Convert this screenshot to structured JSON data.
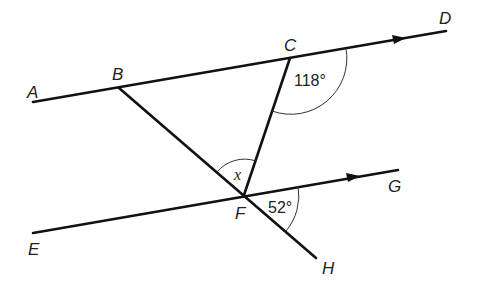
{
  "diagram": {
    "points": {
      "A": {
        "label": "A"
      },
      "B": {
        "label": "B"
      },
      "C": {
        "label": "C"
      },
      "D": {
        "label": "D"
      },
      "E": {
        "label": "E"
      },
      "F": {
        "label": "F"
      },
      "G": {
        "label": "G"
      },
      "H": {
        "label": "H"
      }
    },
    "angles": {
      "dcf": "118°",
      "gfh": "52°",
      "bfc": "x"
    },
    "parallel_lines": [
      "AD",
      "EG"
    ]
  }
}
